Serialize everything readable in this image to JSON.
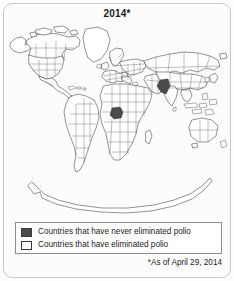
{
  "figure": {
    "title": "2014*",
    "footnote": "*As of April 29, 2014"
  },
  "legend": {
    "items": [
      {
        "swatch": "dark-gray-filled",
        "color": "#4a4a4a",
        "label": "Countries that have never eliminated polio"
      },
      {
        "swatch": "white-outlined",
        "color": "#ffffff",
        "label": "Countries that have eliminated polio"
      }
    ]
  },
  "map": {
    "type": "choropleth-world-map",
    "projection": "equirectangular",
    "land_fill": "#ffffff",
    "border_color": "#3b3b3b",
    "endemic_fill": "#4a4a4a",
    "endemic_countries": [
      "Nigeria",
      "Pakistan",
      "Afghanistan"
    ],
    "continents": [
      "North America",
      "South America",
      "Europe",
      "Africa",
      "Asia",
      "Australia",
      "Antarctica",
      "Greenland"
    ]
  }
}
